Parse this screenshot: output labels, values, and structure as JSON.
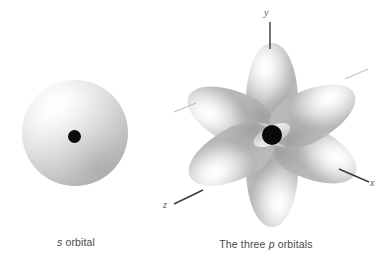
{
  "figure": {
    "background_color": "#ffffff",
    "title": "",
    "panels": [
      {
        "id": "s-orbital",
        "caption_prefix": "s",
        "caption_suffix": " orbital",
        "shape": "sphere",
        "nucleus": "black-dot"
      },
      {
        "id": "p-orbitals",
        "caption_prefix": "The three ",
        "caption_italic": "p",
        "caption_suffix": " orbitals",
        "shape": "six-lobe-rosette",
        "nucleus": "black-dot"
      }
    ]
  },
  "captions": {
    "s_orbital": {
      "italic": "s",
      "rest": " orbital"
    },
    "p_orbitals": {
      "lead": "The three ",
      "italic": "p",
      "rest": " orbitals"
    }
  },
  "axes": {
    "y": "y",
    "x": "x",
    "z": "z"
  },
  "colors": {
    "background": "#ffffff",
    "nucleus": "#0a0a0a",
    "lobe_highlight": "#ffffff",
    "lobe_shadow": "#b4b4b4",
    "caption_text": "#4a4a4a",
    "axis_line": "#3a3a3a"
  }
}
